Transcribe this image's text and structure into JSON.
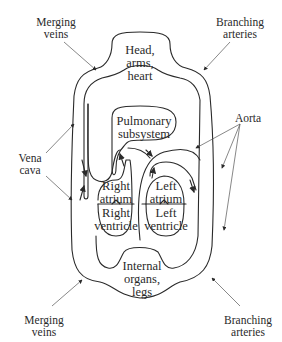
{
  "diagram": {
    "type": "circulatory-system-schematic",
    "compartments": {
      "head": "Head,\narms,\nheart",
      "pulmonary": "Pulmonary\nsubsystem",
      "right_atrium": "Right\natrium",
      "right_ventricle": "Right\nventricle",
      "left_atrium": "Left\natrium",
      "left_ventricle": "Left\nventricle",
      "lower": "Internal\norgans,\nlegs"
    },
    "callouts": {
      "merging_veins_top": "Merging\nveins",
      "branching_arteries_top": "Branching\narteries",
      "vena_cava": "Vena\ncava",
      "aorta": "Aorta",
      "merging_veins_bottom": "Merging\nveins",
      "branching_arteries_bottom": "Branching\narteries"
    },
    "colors": {
      "line": "#2a2a2a",
      "pointer": "#555555",
      "background": "#ffffff"
    }
  }
}
